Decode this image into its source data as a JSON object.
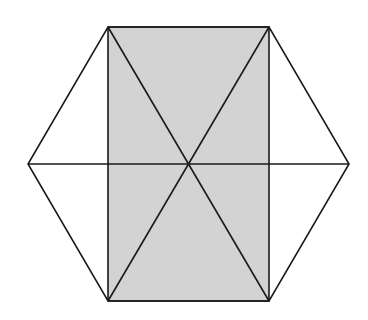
{
  "diagram": {
    "colors": {
      "background": "#ffffff",
      "stroke": "#1a1a1a",
      "shade": "#d3d3d3"
    },
    "stroke_width": 1.6,
    "center": [
      189,
      164
    ],
    "hexagon": {
      "vertices": [
        [
          108,
          27
        ],
        [
          269,
          27
        ],
        [
          349,
          164
        ],
        [
          269,
          301
        ],
        [
          108,
          301
        ],
        [
          28,
          164
        ]
      ]
    },
    "shaded_rectangle": {
      "vertices": [
        [
          108,
          27
        ],
        [
          269,
          27
        ],
        [
          269,
          301
        ],
        [
          108,
          301
        ]
      ]
    },
    "diagonals": [
      {
        "from": [
          108,
          27
        ],
        "to": [
          269,
          301
        ]
      },
      {
        "from": [
          269,
          27
        ],
        "to": [
          108,
          301
        ]
      },
      {
        "from": [
          28,
          164
        ],
        "to": [
          349,
          164
        ]
      }
    ]
  }
}
